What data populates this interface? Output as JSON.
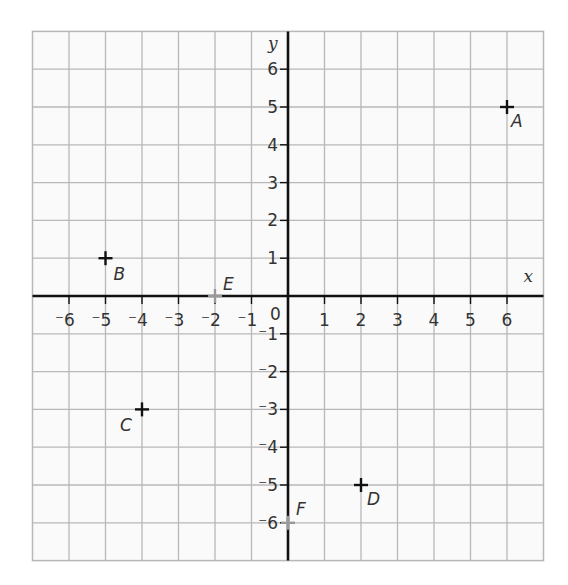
{
  "chart_data": {
    "type": "scatter",
    "title": "",
    "xlabel": "x",
    "ylabel": "y",
    "xlim": [
      -7,
      7
    ],
    "ylim": [
      -7,
      7
    ],
    "grid": true,
    "origin_label": "0",
    "x_ticks": [
      -6,
      -5,
      -4,
      -3,
      -2,
      -1,
      1,
      2,
      3,
      4,
      5,
      6
    ],
    "y_ticks": [
      6,
      5,
      4,
      3,
      2,
      1,
      -1,
      -2,
      -3,
      -4,
      -5,
      -6
    ],
    "points": [
      {
        "label": "A",
        "x": 6,
        "y": 5,
        "color": "#111111"
      },
      {
        "label": "B",
        "x": -5,
        "y": 1,
        "color": "#111111"
      },
      {
        "label": "C",
        "x": -4,
        "y": -3,
        "color": "#111111"
      },
      {
        "label": "D",
        "x": 2,
        "y": -5,
        "color": "#111111"
      },
      {
        "label": "E",
        "x": -2,
        "y": 0,
        "color": "#999999"
      },
      {
        "label": "F",
        "x": 0,
        "y": -6,
        "color": "#999999"
      }
    ]
  },
  "colors": {
    "grid": "#b8b8b8",
    "axis": "#111111",
    "background": "#fafafa",
    "text": "#333333"
  }
}
